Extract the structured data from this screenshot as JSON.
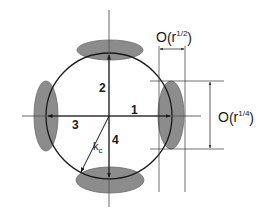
{
  "diagram": {
    "colors": {
      "line": "#1a1a1a",
      "guide": "#333333",
      "ellipse_fill": "#8c8c8c",
      "ellipse_stroke": "#6a6a6a",
      "background": "#ffffff"
    },
    "arrows": [
      {
        "id": "1",
        "label": "1",
        "direction": "right"
      },
      {
        "id": "2",
        "label": "2",
        "direction": "up"
      },
      {
        "id": "3",
        "label": "3",
        "direction": "left"
      },
      {
        "id": "4",
        "label": "4",
        "direction": "down"
      }
    ],
    "radius_label": {
      "main": "k",
      "sub": "c"
    },
    "dimension_width": {
      "prefix": "O",
      "open": "(",
      "base": "r",
      "exponent": "1/2",
      "close": ")"
    },
    "dimension_height": {
      "prefix": "O",
      "open": "(",
      "base": "r",
      "exponent": "1/4",
      "close": ")"
    }
  }
}
